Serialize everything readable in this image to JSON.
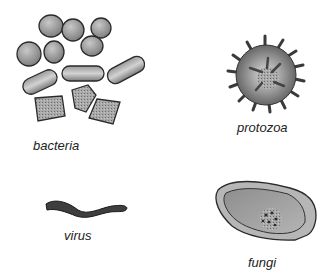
{
  "diagram": {
    "panels": [
      {
        "id": "bacteria",
        "label": "bacteria"
      },
      {
        "id": "protozoa",
        "label": "protozoa"
      },
      {
        "id": "virus",
        "label": "virus"
      },
      {
        "id": "fungi",
        "label": "fungi"
      }
    ]
  }
}
